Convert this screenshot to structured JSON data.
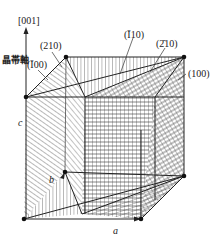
{
  "figure": {
    "axis_label": "[001]",
    "zone_axis_label": "晶帯軸",
    "planes": [
      {
        "id": "p210",
        "label": "(210)"
      },
      {
        "id": "pm100",
        "label": "(Ī00)"
      },
      {
        "id": "pm110",
        "label": "(Ī10)"
      },
      {
        "id": "pm210",
        "label": "(2̄10)"
      },
      {
        "id": "p100",
        "label": "(100)"
      }
    ],
    "axes": {
      "a": "a",
      "b": "b",
      "c": "c"
    },
    "colors": {
      "line": "#222222",
      "background": "#ffffff"
    }
  }
}
